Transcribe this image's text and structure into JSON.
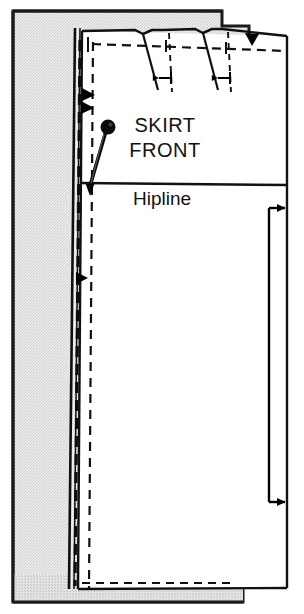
{
  "diagram": {
    "type": "sewing-pattern-layout",
    "labels": {
      "piece_name_line1": "SKIRT",
      "piece_name_line2": "FRONT",
      "hipline": "Hipline"
    },
    "colors": {
      "fabric_gray": "#e3e3e3",
      "fabric_gray_dark": "#d8d8d8",
      "pattern_paper": "#ffffff",
      "ink": "#000000",
      "outline": "#111111"
    },
    "elements": [
      {
        "name": "fabric-panel",
        "kind": "fabric",
        "note": "stippled gray fabric with folded edge at left"
      },
      {
        "name": "fold-edge",
        "kind": "fold",
        "note": "double line along left of pattern"
      },
      {
        "name": "pattern-piece",
        "kind": "paper",
        "note": "white skirt front pattern tissue"
      },
      {
        "name": "cutting-line",
        "kind": "solid-outline"
      },
      {
        "name": "seam-line",
        "kind": "dashed-outline"
      },
      {
        "name": "dart-left",
        "kind": "dart"
      },
      {
        "name": "dart-right",
        "kind": "dart"
      },
      {
        "name": "dart-left-measure",
        "kind": "measure-arrow"
      },
      {
        "name": "dart-right-measure",
        "kind": "measure-arrow"
      },
      {
        "name": "waist-notch",
        "kind": "notch",
        "note": "downward triangle on top edge"
      },
      {
        "name": "side-notch-upper",
        "kind": "notch",
        "note": "right-pointing triangle"
      },
      {
        "name": "side-notch-lower",
        "kind": "notch",
        "note": "right-pointing triangle"
      },
      {
        "name": "hip-notch",
        "kind": "notch"
      },
      {
        "name": "straight-pin",
        "kind": "pin",
        "note": "round-head pin angled through fold edge"
      },
      {
        "name": "grainline-arrow",
        "kind": "grainline",
        "note": "double-ended arrow near right edge"
      }
    ],
    "measurements": {
      "canvas_width": 304,
      "canvas_height": 614
    }
  }
}
